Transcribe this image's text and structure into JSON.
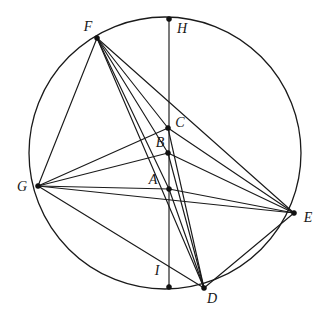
{
  "figure": {
    "background_color": "#ffffff",
    "stroke_color": "#1a1a1a",
    "width": 329,
    "height": 317
  },
  "circle": {
    "name": "main-circle",
    "center_x": 165,
    "center_y": 153,
    "radius": 136
  },
  "points": [
    {
      "id": "F",
      "label": "F",
      "x": 97,
      "y": 38,
      "label_x": 88,
      "label_y": 28,
      "on_circle": true,
      "dot": true
    },
    {
      "id": "H",
      "label": "H",
      "x": 169,
      "y": 19,
      "label_x": 182,
      "label_y": 30,
      "on_circle": true,
      "dot": true
    },
    {
      "id": "C",
      "label": "C",
      "x": 168,
      "y": 128,
      "label_x": 180,
      "label_y": 124,
      "on_circle": false,
      "dot": true
    },
    {
      "id": "B",
      "label": "B",
      "x": 168,
      "y": 153,
      "label_x": 160,
      "label_y": 144,
      "on_circle": false,
      "dot": true
    },
    {
      "id": "A",
      "label": "A",
      "x": 169,
      "y": 189,
      "label_x": 153,
      "label_y": 181,
      "on_circle": false,
      "dot": true
    },
    {
      "id": "G",
      "label": "G",
      "x": 38,
      "y": 186,
      "label_x": 22,
      "label_y": 188,
      "on_circle": true,
      "dot": true
    },
    {
      "id": "E",
      "label": "E",
      "x": 294,
      "y": 213,
      "label_x": 308,
      "label_y": 219,
      "on_circle": true,
      "dot": true
    },
    {
      "id": "D",
      "label": "D",
      "x": 204,
      "y": 288,
      "label_x": 212,
      "label_y": 300,
      "on_circle": true,
      "dot": true
    },
    {
      "id": "I",
      "label": "I",
      "x": 169,
      "y": 287,
      "label_x": 157,
      "label_y": 272,
      "on_circle": true,
      "dot": true
    }
  ],
  "segments": [
    {
      "name": "segment-H-I",
      "from": "H",
      "to": "I"
    },
    {
      "name": "segment-F-G",
      "from": "F",
      "to": "G"
    },
    {
      "name": "segment-F-C",
      "from": "F",
      "to": "C"
    },
    {
      "name": "segment-F-B",
      "from": "F",
      "to": "B"
    },
    {
      "name": "segment-F-A",
      "from": "F",
      "to": "A"
    },
    {
      "name": "segment-F-D",
      "from": "F",
      "to": "D"
    },
    {
      "name": "segment-F-E",
      "from": "F",
      "to": "E"
    },
    {
      "name": "segment-G-C",
      "from": "G",
      "to": "C"
    },
    {
      "name": "segment-G-B",
      "from": "G",
      "to": "B"
    },
    {
      "name": "segment-G-A",
      "from": "G",
      "to": "A"
    },
    {
      "name": "segment-G-E",
      "from": "G",
      "to": "E"
    },
    {
      "name": "segment-G-D",
      "from": "G",
      "to": "D"
    },
    {
      "name": "segment-C-E",
      "from": "C",
      "to": "E"
    },
    {
      "name": "segment-B-E",
      "from": "B",
      "to": "E"
    },
    {
      "name": "segment-A-E",
      "from": "A",
      "to": "E"
    },
    {
      "name": "segment-D-E",
      "from": "D",
      "to": "E"
    },
    {
      "name": "segment-D-C",
      "from": "D",
      "to": "C"
    },
    {
      "name": "segment-D-B",
      "from": "D",
      "to": "B"
    },
    {
      "name": "segment-D-A",
      "from": "D",
      "to": "A"
    }
  ],
  "labels": {
    "A": "A",
    "B": "B",
    "C": "C",
    "D": "D",
    "E": "E",
    "F": "F",
    "G": "G",
    "H": "H",
    "I": "I"
  }
}
